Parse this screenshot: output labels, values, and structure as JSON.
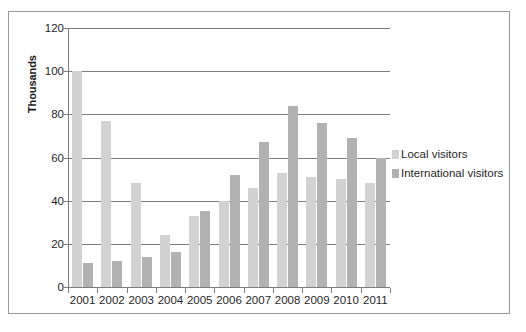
{
  "chart_data": {
    "type": "bar",
    "title": "",
    "subtitle": "",
    "xlabel": "",
    "ylabel": "Thousands",
    "categories": [
      "2001",
      "2002",
      "2003",
      "2004",
      "2005",
      "2006",
      "2007",
      "2008",
      "2009",
      "2010",
      "2011"
    ],
    "series": [
      {
        "name": "Local visitors",
        "color": "#d2d2d2",
        "values": [
          100,
          77,
          48,
          24,
          33,
          40,
          46,
          53,
          51,
          50,
          48
        ]
      },
      {
        "name": "International visitors",
        "color": "#b2b2b2",
        "values": [
          11,
          12,
          14,
          16,
          35,
          52,
          67,
          84,
          76,
          69,
          60
        ]
      }
    ],
    "ylim": [
      0,
      120
    ],
    "y_ticks": [
      0,
      20,
      40,
      60,
      80,
      100,
      120
    ],
    "y_tick_labels": [
      "0",
      "20",
      "40",
      "60",
      "80",
      "100",
      "120"
    ],
    "grid": true,
    "grid_axis": "y",
    "legend": true,
    "legend_position": "right",
    "legend_entries": [
      "Local visitors",
      "International visitors"
    ],
    "axis_color": "#7d7d7d",
    "background": "#ffffff",
    "frame_border_color": "#9a9a9a"
  }
}
